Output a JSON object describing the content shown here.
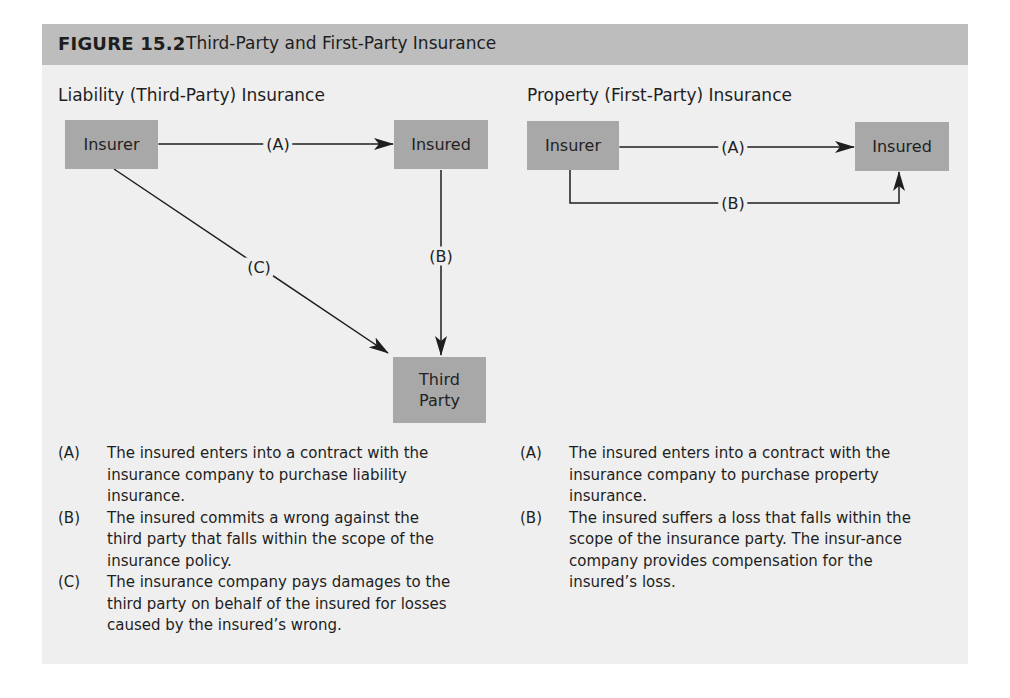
{
  "header": {
    "figure_number": "FIGURE 15.2",
    "title": "Third-Party and First-Party Insurance"
  },
  "liability": {
    "title": "Liability (Third-Party) Insurance",
    "nodes": {
      "insurer": "Insurer",
      "insured": "Insured",
      "third_party": "Third Party"
    },
    "edges": {
      "a": "(A)",
      "b": "(B)",
      "c": "(C)"
    },
    "legend": [
      {
        "key": "(A)",
        "text": "The insured enters into a contract with the insurance company to purchase liability insurance."
      },
      {
        "key": "(B)",
        "text": "The insured commits a wrong against the third party that falls within the scope of the insurance policy."
      },
      {
        "key": "(C)",
        "text": "The insurance company pays damages to the third party on behalf of the insured for losses caused by the insured’s wrong."
      }
    ]
  },
  "property": {
    "title": "Property (First-Party) Insurance",
    "nodes": {
      "insurer": "Insurer",
      "insured": "Insured"
    },
    "edges": {
      "a": "(A)",
      "b": "(B)"
    },
    "legend": [
      {
        "key": "(A)",
        "text": "The insured enters into a contract with the insurance company to purchase property insurance."
      },
      {
        "key": "(B)",
        "text": "The insured suffers a loss that falls within the scope of the insurance party. The insur-ance company provides compensation for the insured’s loss."
      }
    ]
  },
  "colors": {
    "panel": "#efefef",
    "header": "#bdbdbd",
    "box": "#a8a8a8",
    "line": "#1e1e1e"
  }
}
